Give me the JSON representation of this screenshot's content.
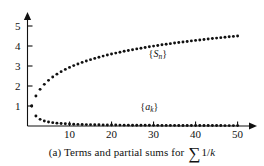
{
  "figure": {
    "caption_prefix": "(a) Terms and partial sums for",
    "caption_sigma": "∑",
    "caption_fraction": "1/",
    "caption_variable": "k",
    "caption_full": "(a) Terms and partial sums for ∑1/k",
    "background_color": "#ffffff",
    "ink_color": "#111111"
  },
  "chart_data": {
    "type": "scatter",
    "xlabel": "",
    "ylabel": "",
    "xlim": [
      0,
      52
    ],
    "ylim": [
      0,
      5.4
    ],
    "grid": false,
    "legend": "inline-annotations",
    "xticks": [
      10,
      20,
      30,
      40,
      50
    ],
    "xtick_labels": [
      "10",
      "20",
      "30",
      "40",
      "50"
    ],
    "yticks": [
      1,
      2,
      3,
      4,
      5
    ],
    "ytick_labels": [
      "1",
      "2",
      "3",
      "4",
      "5"
    ],
    "x": [
      1,
      2,
      3,
      4,
      5,
      6,
      7,
      8,
      9,
      10,
      11,
      12,
      13,
      14,
      15,
      16,
      17,
      18,
      19,
      20,
      21,
      22,
      23,
      24,
      25,
      26,
      27,
      28,
      29,
      30,
      31,
      32,
      33,
      34,
      35,
      36,
      37,
      38,
      39,
      40,
      41,
      42,
      43,
      44,
      45,
      46,
      47,
      48,
      49,
      50
    ],
    "series": [
      {
        "name": "{S_n}",
        "label": "{S",
        "label_sub": "n",
        "label_close": "}",
        "description": "partial sums of the harmonic series",
        "marker": "dot",
        "color": "#111111",
        "label_x": 31,
        "label_y": 3.45,
        "values": [
          1.0,
          1.5,
          1.833,
          2.083,
          2.283,
          2.45,
          2.593,
          2.718,
          2.829,
          2.929,
          3.02,
          3.103,
          3.18,
          3.252,
          3.318,
          3.381,
          3.44,
          3.495,
          3.548,
          3.598,
          3.645,
          3.691,
          3.734,
          3.776,
          3.816,
          3.854,
          3.891,
          3.927,
          3.962,
          3.995,
          4.027,
          4.059,
          4.089,
          4.118,
          4.147,
          4.175,
          4.202,
          4.228,
          4.254,
          4.279,
          4.303,
          4.327,
          4.35,
          4.373,
          4.395,
          4.417,
          4.438,
          4.459,
          4.479,
          4.499
        ]
      },
      {
        "name": "{a_k}",
        "label": "{a",
        "label_sub": "k",
        "label_close": "}",
        "description": "terms a_k = 1/k",
        "marker": "dot",
        "color": "#111111",
        "label_x": 29,
        "label_y": 0.82,
        "values": [
          1.0,
          0.5,
          0.333,
          0.25,
          0.2,
          0.167,
          0.143,
          0.125,
          0.111,
          0.1,
          0.091,
          0.083,
          0.077,
          0.071,
          0.067,
          0.063,
          0.059,
          0.056,
          0.053,
          0.05,
          0.048,
          0.045,
          0.043,
          0.042,
          0.04,
          0.038,
          0.037,
          0.036,
          0.034,
          0.033,
          0.032,
          0.031,
          0.03,
          0.029,
          0.029,
          0.028,
          0.027,
          0.026,
          0.026,
          0.025,
          0.024,
          0.024,
          0.023,
          0.023,
          0.022,
          0.022,
          0.021,
          0.021,
          0.02,
          0.02
        ]
      }
    ]
  }
}
